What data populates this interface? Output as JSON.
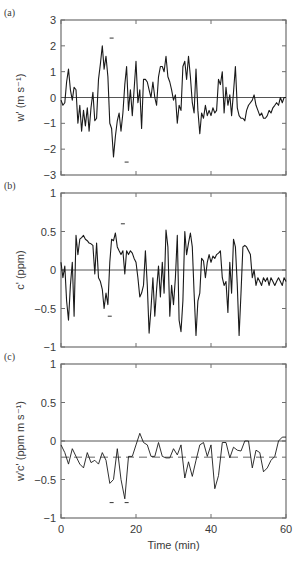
{
  "chart_data": [
    {
      "panel": "(a)",
      "type": "line",
      "title": "",
      "xlabel": "",
      "ylabel": "w' (m s⁻¹)",
      "ylim": [
        -3,
        3
      ],
      "yticks": [
        -3,
        -2,
        -1,
        0,
        1,
        2,
        3
      ],
      "ytick_labels": [
        "−3",
        "−2",
        "−1",
        "0",
        "1",
        "2",
        "3"
      ],
      "xlim": [
        0,
        60
      ],
      "xticks": [
        0,
        20,
        40,
        60
      ],
      "show_xtick_labels": false,
      "zero_line": true,
      "markers": [
        {
          "x": 13.5,
          "y": 2.3
        },
        {
          "x": 17.5,
          "y": -2.5
        }
      ],
      "x": [
        0,
        0.5,
        1,
        1.5,
        2,
        2.5,
        3,
        3.5,
        4,
        4.5,
        5,
        5.5,
        6,
        6.5,
        7,
        7.5,
        8,
        8.5,
        9,
        9.5,
        10,
        10.5,
        11,
        11.5,
        12,
        12.5,
        13,
        13.5,
        14,
        14.5,
        15,
        15.5,
        16,
        16.5,
        17,
        17.5,
        18,
        18.5,
        19,
        19.5,
        20,
        20.5,
        21,
        21.5,
        22,
        22.5,
        23,
        23.5,
        24,
        24.5,
        25,
        25.5,
        26,
        26.5,
        27,
        27.5,
        28,
        28.5,
        29,
        29.5,
        30,
        30.5,
        31,
        31.5,
        32,
        32.5,
        33,
        33.5,
        34,
        34.5,
        35,
        35.5,
        36,
        36.5,
        37,
        37.5,
        38,
        38.5,
        39,
        39.5,
        40,
        40.5,
        41,
        41.5,
        42,
        42.5,
        43,
        43.5,
        44,
        44.5,
        45,
        45.5,
        46,
        46.5,
        47,
        47.5,
        48,
        48.5,
        49,
        49.5,
        50,
        50.5,
        51,
        51.5,
        52,
        52.5,
        53,
        53.5,
        54,
        54.5,
        55,
        55.5,
        56,
        56.5,
        57,
        57.5,
        58,
        58.5,
        59,
        59.5,
        60
      ],
      "values": [
        -0.1,
        -0.3,
        -0.2,
        0.6,
        1.1,
        0.3,
        -0.1,
        0.4,
        0.3,
        -1.0,
        -0.3,
        -1.3,
        -0.5,
        -1.1,
        -0.4,
        -1.3,
        -0.4,
        0.2,
        -0.9,
        -0.8,
        0.7,
        1.3,
        2.0,
        1.1,
        1.6,
        0.8,
        -1.0,
        -1.2,
        -2.3,
        -1.5,
        -0.9,
        -0.6,
        -1.3,
        -0.6,
        0.5,
        1.2,
        -0.5,
        0.3,
        -0.7,
        0.3,
        1.4,
        -0.2,
        0.3,
        -1.2,
        0.7,
        0.7,
        0.6,
        0.3,
        0.0,
        0.6,
        0.0,
        -0.3,
        0.8,
        1.2,
        1.2,
        1.0,
        1.6,
        0.8,
        0.6,
        0.3,
        -0.1,
        0.1,
        -1.0,
        -0.3,
        -0.5,
        1.2,
        1.4,
        0.7,
        1.6,
        0.8,
        -0.2,
        -0.6,
        1.1,
        -0.5,
        -1.4,
        -0.6,
        -0.8,
        -0.3,
        -0.7,
        -0.5,
        -0.7,
        -0.4,
        -0.6,
        -0.5,
        0.7,
        0.5,
        1.0,
        -0.6,
        0.4,
        -0.3,
        0.1,
        -0.7,
        0.2,
        1.2,
        -0.4,
        -0.7,
        -0.8,
        -0.8,
        -0.9,
        -0.5,
        -0.3,
        -0.2,
        -0.1,
        0.1,
        -0.3,
        -0.5,
        -0.7,
        -0.6,
        -0.8,
        -0.8,
        -0.7,
        -0.5,
        -0.6,
        -0.4,
        -0.3,
        -0.2,
        -0.3,
        0.0,
        -0.2,
        0.0,
        0.0
      ]
    },
    {
      "panel": "(b)",
      "type": "line",
      "title": "",
      "xlabel": "",
      "ylabel": "c' (ppm)",
      "ylim": [
        -1,
        1
      ],
      "yticks": [
        -1,
        -0.5,
        0,
        0.5,
        1
      ],
      "ytick_labels": [
        "−1",
        "−0.5",
        "0",
        "0.5",
        "1"
      ],
      "xlim": [
        0,
        60
      ],
      "xticks": [
        0,
        20,
        40,
        60
      ],
      "show_xtick_labels": false,
      "zero_line": true,
      "markers": [
        {
          "x": 16.5,
          "y": 0.6
        },
        {
          "x": 13.0,
          "y": -0.6
        }
      ],
      "x": [
        0,
        0.5,
        1,
        1.5,
        2,
        2.5,
        3,
        3.5,
        4,
        4.5,
        5,
        5.5,
        6,
        6.5,
        7,
        7.5,
        8,
        8.5,
        9,
        9.5,
        10,
        10.5,
        11,
        11.5,
        12,
        12.5,
        13,
        13.5,
        14,
        14.5,
        15,
        15.5,
        16,
        16.5,
        17,
        17.5,
        18,
        18.5,
        19,
        19.5,
        20,
        20.5,
        21,
        21.5,
        22,
        22.5,
        23,
        23.5,
        24,
        24.5,
        25,
        25.5,
        26,
        26.5,
        27,
        27.5,
        28,
        28.5,
        29,
        29.5,
        30,
        30.5,
        31,
        31.5,
        32,
        32.5,
        33,
        33.5,
        34,
        34.5,
        35,
        35.5,
        36,
        36.5,
        37,
        37.5,
        38,
        38.5,
        39,
        39.5,
        40,
        40.5,
        41,
        41.5,
        42,
        42.5,
        43,
        43.5,
        44,
        44.5,
        45,
        45.5,
        46,
        46.5,
        47,
        47.5,
        48,
        48.5,
        49,
        49.5,
        50,
        50.5,
        51,
        51.5,
        52,
        52.5,
        53,
        53.5,
        54,
        54.5,
        55,
        55.5,
        56,
        56.5,
        57,
        57.5,
        58,
        58.5,
        59,
        59.5,
        60
      ],
      "values": [
        0.1,
        -0.1,
        0.05,
        -0.4,
        -0.65,
        -0.2,
        0.1,
        -0.6,
        0.45,
        0.2,
        0.4,
        0.42,
        0.45,
        0.4,
        0.38,
        0.35,
        0.34,
        0.32,
        -0.05,
        0.35,
        -0.1,
        -0.15,
        -0.25,
        -0.5,
        -0.3,
        -0.45,
        0.1,
        0.4,
        0.38,
        0.48,
        0.3,
        0.25,
        0.2,
        0.25,
        -0.05,
        0.25,
        0.2,
        0.25,
        0.22,
        0.15,
        0.1,
        -0.1,
        -0.35,
        -0.3,
        -0.2,
        0.25,
        -0.2,
        -0.82,
        -0.5,
        -0.1,
        -0.6,
        -0.25,
        0.05,
        -0.35,
        0.1,
        -0.3,
        0.52,
        0.3,
        -0.6,
        -0.2,
        -0.45,
        -0.1,
        0.45,
        -0.65,
        -0.8,
        -0.4,
        0.5,
        0.2,
        0.35,
        0.48,
        0.3,
        -0.3,
        -0.85,
        -0.4,
        -0.3,
        0.15,
        0.12,
        -0.1,
        0.1,
        0.2,
        0.1,
        0.18,
        0.15,
        0.2,
        0.22,
        0.25,
        -0.1,
        -0.2,
        -0.15,
        -0.55,
        0.1,
        -0.3,
        0.4,
        0.3,
        -0.2,
        -0.85,
        -0.3,
        0.3,
        0.32,
        0.3,
        0.25,
        0.2,
        -0.1,
        0.0,
        -0.2,
        -0.1,
        -0.15,
        -0.2,
        -0.1,
        -0.15,
        -0.1,
        -0.2,
        -0.1,
        -0.15,
        -0.2,
        -0.15,
        -0.1,
        -0.15,
        -0.2,
        -0.1,
        -0.15
      ]
    },
    {
      "panel": "(c)",
      "type": "line",
      "title": "",
      "xlabel": "Time (min)",
      "ylabel": "w'c' (ppm m s⁻¹)",
      "ylim": [
        -1,
        1
      ],
      "yticks": [
        -1,
        -0.5,
        0,
        0.5,
        1
      ],
      "ytick_labels": [
        "−1",
        "−0.5",
        "0",
        "0.5",
        "1"
      ],
      "xlim": [
        0,
        60
      ],
      "xticks": [
        0,
        20,
        40,
        60
      ],
      "xtick_labels": [
        "0",
        "20",
        "40",
        "60"
      ],
      "show_xtick_labels": true,
      "zero_line": true,
      "mean_line": -0.21,
      "markers": [
        {
          "x": 13.5,
          "y": -0.8
        },
        {
          "x": 17.5,
          "y": -0.8
        }
      ],
      "x": [
        0,
        1,
        2,
        3,
        4,
        5,
        6,
        7,
        8,
        9,
        10,
        11,
        12,
        13,
        14,
        15,
        16,
        17,
        18,
        19,
        20,
        21,
        22,
        23,
        24,
        25,
        26,
        27,
        28,
        29,
        30,
        31,
        32,
        33,
        34,
        35,
        36,
        37,
        38,
        39,
        40,
        41,
        42,
        43,
        44,
        45,
        46,
        47,
        48,
        49,
        50,
        51,
        52,
        53,
        54,
        55,
        56,
        57,
        58,
        59,
        60
      ],
      "values": [
        -0.05,
        -0.15,
        -0.3,
        -0.1,
        -0.2,
        -0.3,
        -0.35,
        -0.15,
        -0.28,
        -0.25,
        -0.3,
        -0.15,
        -0.25,
        -0.55,
        -0.5,
        -0.1,
        -0.5,
        -0.75,
        -0.2,
        -0.2,
        -0.05,
        0.1,
        -0.02,
        -0.05,
        -0.2,
        -0.2,
        -0.02,
        -0.2,
        -0.22,
        -0.22,
        -0.1,
        -0.18,
        -0.05,
        -0.48,
        -0.27,
        -0.46,
        -0.25,
        -0.05,
        -0.02,
        -0.2,
        -0.05,
        -0.62,
        -0.45,
        -0.02,
        -0.02,
        -0.22,
        -0.08,
        -0.12,
        -0.13,
        0.0,
        0.0,
        -0.35,
        -0.12,
        -0.15,
        -0.4,
        -0.35,
        -0.25,
        -0.2,
        0.0,
        0.05,
        0.05
      ]
    }
  ]
}
